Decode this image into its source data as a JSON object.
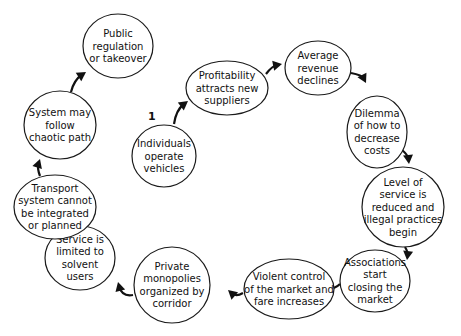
{
  "start_marker": "1",
  "nodes": [
    {
      "id": "individuals",
      "lines": [
        "Individuals",
        "operate",
        "vehicles"
      ]
    },
    {
      "id": "profitability",
      "lines": [
        "Profitability",
        "attracts new",
        "suppliers"
      ]
    },
    {
      "id": "average-revenue",
      "lines": [
        "Average",
        "revenue",
        "declines"
      ]
    },
    {
      "id": "dilemma",
      "lines": [
        "Dilemma",
        "of how to",
        "decrease",
        "costs"
      ]
    },
    {
      "id": "level-of-service",
      "lines": [
        "Level of",
        "service is",
        "reduced and",
        "illegal practices",
        "begin"
      ]
    },
    {
      "id": "associations",
      "lines": [
        "Associations",
        "start",
        "closing the",
        "market"
      ]
    },
    {
      "id": "violent-control",
      "lines": [
        "Violent control",
        "of the market and",
        "fare increases"
      ]
    },
    {
      "id": "private-monopolies",
      "lines": [
        "Private",
        "monopolies",
        "organized by",
        "corridor"
      ]
    },
    {
      "id": "service-limited",
      "lines": [
        "Service is",
        "limited to",
        "solvent",
        "users"
      ]
    },
    {
      "id": "transport-system",
      "lines": [
        "Transport",
        "system cannot",
        "be integrated",
        "or planned"
      ]
    },
    {
      "id": "system-chaotic",
      "lines": [
        "System may",
        "follow",
        "chaotic path"
      ]
    },
    {
      "id": "public-regulation",
      "lines": [
        "Public",
        "regulation",
        "or takeover"
      ]
    }
  ],
  "edges": [
    {
      "from": "individuals",
      "to": "profitability"
    },
    {
      "from": "profitability",
      "to": "average-revenue"
    },
    {
      "from": "average-revenue",
      "to": "dilemma"
    },
    {
      "from": "dilemma",
      "to": "level-of-service"
    },
    {
      "from": "level-of-service",
      "to": "associations"
    },
    {
      "from": "associations",
      "to": "violent-control"
    },
    {
      "from": "violent-control",
      "to": "private-monopolies"
    },
    {
      "from": "private-monopolies",
      "to": "service-limited"
    },
    {
      "from": "service-limited",
      "to": "transport-system"
    },
    {
      "from": "transport-system",
      "to": "system-chaotic"
    },
    {
      "from": "system-chaotic",
      "to": "public-regulation"
    }
  ]
}
